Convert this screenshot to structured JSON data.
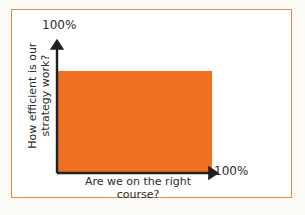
{
  "figure": {
    "border_color": "#e08a4e",
    "background_color": "#ffffff",
    "page_background": "#fdfbf8"
  },
  "chart_data": {
    "type": "area",
    "title": "",
    "xlabel": "Are we on the right course?",
    "ylabel": "How efficient is our strategy work?",
    "xlim": [
      0,
      100
    ],
    "ylim": [
      0,
      100
    ],
    "x_tick_labels": [
      "100%"
    ],
    "y_tick_labels": [
      "100%"
    ],
    "grid": false,
    "legend": "none",
    "series": [
      {
        "name": "coverage-region",
        "color": "#f07023",
        "shape": "rectangle",
        "x_start": 0,
        "x_end": 88,
        "y_start": 0,
        "y_end": 85
      }
    ],
    "annotations": []
  },
  "axes": {
    "y_max_label": "100%",
    "x_max_label": "100%",
    "y_title_line1": "How efficient is our",
    "y_title_line2": "strategy work?",
    "x_title_line1": "Are we on the right",
    "x_title_line2": "course?",
    "line_color": "#231f20"
  }
}
